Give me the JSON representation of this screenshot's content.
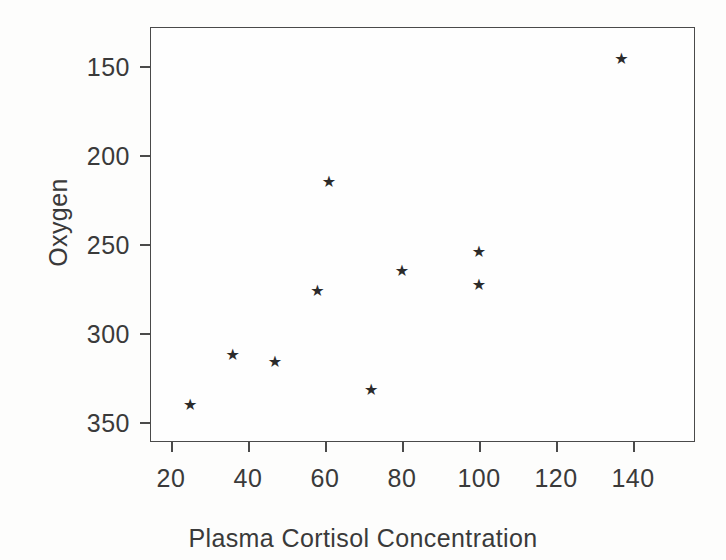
{
  "chart_data": {
    "type": "scatter",
    "title": "",
    "xlabel": "Plasma Cortisol Concentration",
    "ylabel": "Oxygen",
    "xlim": [
      14,
      145
    ],
    "ylim": [
      145,
      358
    ],
    "xticks": [
      20,
      40,
      60,
      80,
      100,
      120,
      140
    ],
    "yticks": [
      150,
      200,
      250,
      300,
      350
    ],
    "grid": false,
    "legend": null,
    "marker": "star",
    "marker_color": "#2b2b2b",
    "series": [
      {
        "name": "observations",
        "points": [
          {
            "x": 25,
            "y": 160
          },
          {
            "x": 36,
            "y": 188
          },
          {
            "x": 47,
            "y": 184
          },
          {
            "x": 58,
            "y": 224
          },
          {
            "x": 61,
            "y": 285
          },
          {
            "x": 72,
            "y": 168
          },
          {
            "x": 80,
            "y": 235
          },
          {
            "x": 100,
            "y": 246
          },
          {
            "x": 100,
            "y": 227
          },
          {
            "x": 137,
            "y": 354
          }
        ]
      }
    ]
  },
  "axes": {
    "y_tick_labels": [
      "350",
      "300",
      "250",
      "200",
      "150"
    ],
    "x_tick_labels": [
      "20",
      "40",
      "60",
      "80",
      "100",
      "120",
      "140"
    ],
    "y_title": "Oxygen",
    "x_title": "Plasma Cortisol Concentration"
  }
}
